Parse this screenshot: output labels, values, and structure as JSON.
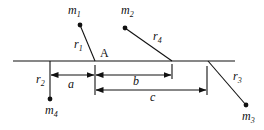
{
  "diagram": {
    "colors": {
      "ink": "#111111",
      "background": "#ffffff"
    },
    "reference_line": {
      "x1": 13,
      "x2": 235,
      "y": 61
    },
    "point_A": {
      "label": "A",
      "x": 95,
      "y": 61
    },
    "masses": [
      {
        "id": "m1",
        "base": "m",
        "sub": "1",
        "dot": [
          80,
          25
        ],
        "anchor": [
          95,
          61
        ],
        "rod": "r",
        "rod_sub": "1"
      },
      {
        "id": "m2",
        "base": "m",
        "sub": "2",
        "dot": [
          125,
          28
        ],
        "anchor": [
          172,
          61
        ],
        "rod": "r",
        "rod_sub": "4"
      },
      {
        "id": "m3",
        "base": "m",
        "sub": "3",
        "dot": [
          246,
          105
        ],
        "anchor": [
          208,
          61
        ],
        "rod": "r",
        "rod_sub": "3"
      },
      {
        "id": "m4",
        "base": "m",
        "sub": "4",
        "dot": [
          50,
          99
        ],
        "anchor": [
          50,
          61
        ],
        "rod": "r",
        "rod_sub": "2"
      }
    ],
    "dimensions": [
      {
        "label": "a",
        "from": 50,
        "to": 95,
        "y": 75
      },
      {
        "label": "b",
        "from": 95,
        "to": 172,
        "y": 75
      },
      {
        "label": "c",
        "from": 95,
        "to": 207,
        "y": 90
      }
    ],
    "labels": {
      "m1": {
        "base": "m",
        "sub": "1"
      },
      "m2": {
        "base": "m",
        "sub": "2"
      },
      "m3": {
        "base": "m",
        "sub": "3"
      },
      "m4": {
        "base": "m",
        "sub": "4"
      },
      "r1": {
        "base": "r",
        "sub": "1"
      },
      "r2": {
        "base": "r",
        "sub": "2"
      },
      "r3": {
        "base": "r",
        "sub": "3"
      },
      "r4": {
        "base": "r",
        "sub": "4"
      },
      "A": "A",
      "a": "a",
      "b": "b",
      "c": "c"
    }
  }
}
